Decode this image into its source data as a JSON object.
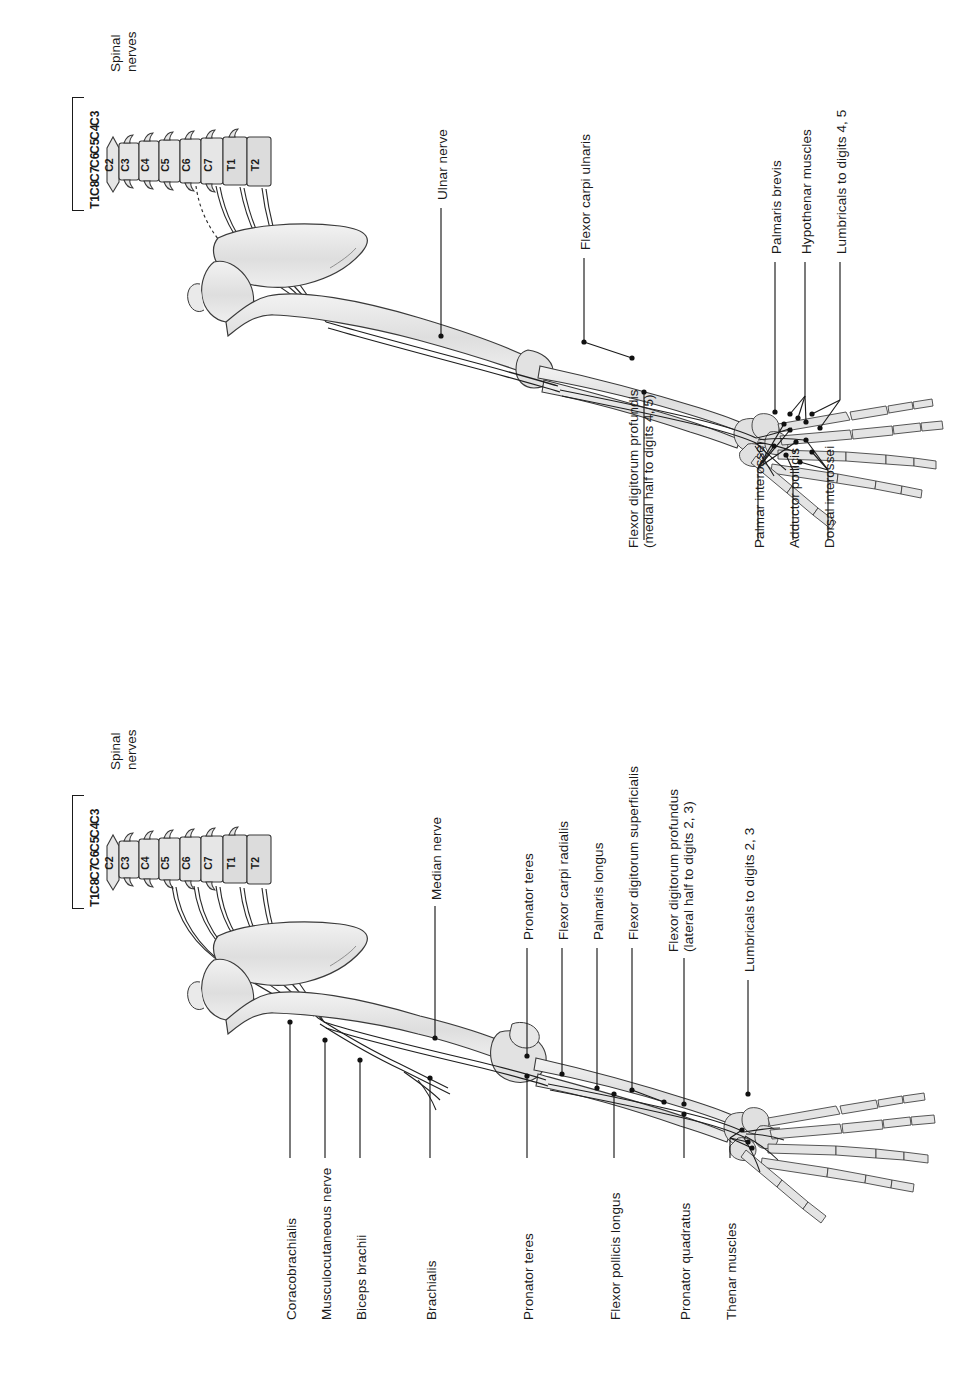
{
  "figure": {
    "title_hidden": "",
    "orientation": "rotated-90-ccw",
    "panels": [
      {
        "id": "ulnar",
        "nerve": "Ulnar nerve",
        "spinal": {
          "heading_line1": "Spinal",
          "heading_line2": "nerves",
          "vertebrae": [
            "C2",
            "C3",
            "C4",
            "C5",
            "C6",
            "C7",
            "T1",
            "T2"
          ],
          "roots": [
            "C3",
            "C4",
            "C5",
            "C6",
            "C7",
            "C8",
            "T1"
          ]
        },
        "labels": [
          {
            "text": "Ulnar nerve"
          },
          {
            "text": "Flexor carpi ulnaris"
          },
          {
            "text": "Palmaris brevis"
          },
          {
            "text": "Hypothenar muscles"
          },
          {
            "text": "Lumbricals to digits 4, 5"
          },
          {
            "text_line1": "Flexor digitorum profundis",
            "text_line2": "(medial half to digits 4, 5)"
          },
          {
            "text": "Palmar interossei"
          },
          {
            "text": "Adductor pollicis"
          },
          {
            "text": "Dorsal interossei"
          }
        ]
      },
      {
        "id": "median",
        "nerve": "Median nerve",
        "spinal": {
          "heading_line1": "Spinal",
          "heading_line2": "nerves",
          "vertebrae": [
            "C2",
            "C3",
            "C4",
            "C5",
            "C6",
            "C7",
            "T1",
            "T2"
          ],
          "roots": [
            "C3",
            "C4",
            "C5",
            "C6",
            "C7",
            "C8",
            "T1"
          ]
        },
        "labels": [
          {
            "text": "Median nerve"
          },
          {
            "text": "Pronator teres"
          },
          {
            "text": "Flexor carpi radialis"
          },
          {
            "text": "Palmaris longus"
          },
          {
            "text": "Flexor digitorum superficialis"
          },
          {
            "text_line1": "Flexor digitorum profundus",
            "text_line2": "(lateral half to digits 2, 3)"
          },
          {
            "text": "Lumbricals to digits 2, 3"
          },
          {
            "text": "Coracobrachialis"
          },
          {
            "text": "Musculocutaneous nerve"
          },
          {
            "text": "Biceps brachii"
          },
          {
            "text": "Brachialis"
          },
          {
            "text": "Pronator teres"
          },
          {
            "text": "Flexor pollicis longus"
          },
          {
            "text": "Pronator quadratus"
          },
          {
            "text": "Thenar muscles"
          }
        ]
      }
    ]
  },
  "colors": {
    "ink": "#1a1a1a",
    "bone_fill": "#e3e3e3",
    "bone_fill_light": "#ededed",
    "bone_stroke": "#3a3a3a",
    "background": "#ffffff"
  }
}
